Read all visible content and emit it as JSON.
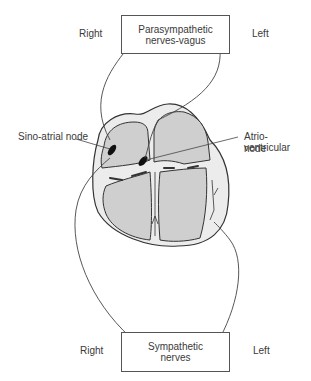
{
  "diagram": {
    "top_box": {
      "line1": "Parasympathetic",
      "line2": "nerves-vagus"
    },
    "bottom_box": {
      "line1": "Sympathetic",
      "line2": "nerves"
    },
    "top_right_label": "Right",
    "top_left_label": "Left",
    "bottom_right_label": "Right",
    "bottom_left_label": "Left",
    "sa_node_label": "Sino-atrial node",
    "av_node_label_line1": "Atrio-ventricular",
    "av_node_label_line2": "node"
  },
  "colors": {
    "chamber_fill": "#cfcfcf",
    "wall_fill": "#ececec",
    "outline": "#333333",
    "node_fill": "#111111"
  }
}
